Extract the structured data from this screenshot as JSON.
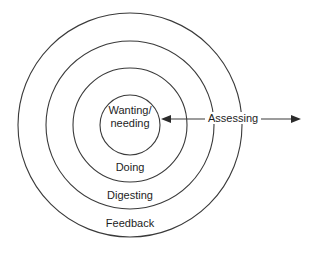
{
  "diagram": {
    "stroke_color": "#3a3a3a",
    "text_color": "#1d1d1d",
    "background_color": "#ffffff",
    "center": {
      "x": 130,
      "y": 125
    },
    "rings": [
      {
        "name": "feedback",
        "label": "Feedback",
        "radius": 112,
        "label_x": 130,
        "label_y": 222
      },
      {
        "name": "digesting",
        "label": "Digesting",
        "radius": 84,
        "label_x": 130,
        "label_y": 195
      },
      {
        "name": "doing",
        "label": "Doing",
        "radius": 57,
        "label_x": 130,
        "label_y": 168
      },
      {
        "name": "wanting-needing",
        "label": "Wanting/\nneeding",
        "label_line_1": "Wanting/",
        "label_line_2": "needing",
        "radius": 30,
        "label_x": 130,
        "label_y": 111
      }
    ],
    "connector": {
      "name": "assessing-arrow",
      "label": "Assessing",
      "label_x": 235,
      "label_y": 112,
      "y": 119,
      "x_start": 161,
      "x_end": 301,
      "left_arrow": true,
      "right_arrow": true
    }
  }
}
